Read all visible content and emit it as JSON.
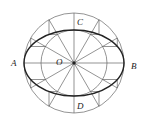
{
  "diagram": {
    "center": {
      "x": 74,
      "y": 63
    },
    "outer_radius": 50,
    "inner_radius": 33,
    "radial_divisions": 12,
    "colors": {
      "line": "#555555",
      "ellipse": "#222222",
      "text": "#222222"
    },
    "labels": {
      "A": "A",
      "B": "B",
      "C": "C",
      "D": "D",
      "O": "O"
    }
  }
}
